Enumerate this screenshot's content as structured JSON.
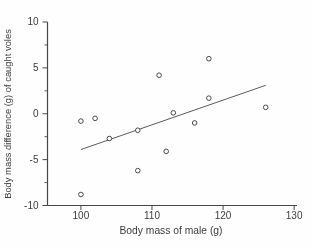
{
  "figure": {
    "background": "#fefefe",
    "ink_color": "#474747",
    "text_color": "#3c3c3c"
  },
  "chart_data": {
    "type": "scatter",
    "xlabel": "Body mass of male (g)",
    "ylabel": "Body mass difference (g) of caught voles",
    "xlim": [
      95.3,
      130.4
    ],
    "ylim": [
      -10,
      10
    ],
    "x_ticks": [
      100,
      110,
      120,
      130
    ],
    "y_ticks": [
      10,
      5,
      0,
      -5,
      -10
    ],
    "y_minor_ticks": [
      7.5,
      2.5,
      -2.5,
      -7.5
    ],
    "grid": false,
    "legend": "none",
    "marker": "open-circle",
    "points": [
      [
        100,
        -0.8
      ],
      [
        100,
        -8.8
      ],
      [
        102,
        -0.5
      ],
      [
        104,
        -2.7
      ],
      [
        108,
        -1.8
      ],
      [
        108,
        -6.2
      ],
      [
        111,
        4.2
      ],
      [
        112,
        -4.1
      ],
      [
        113,
        0.1
      ],
      [
        116,
        -1.0
      ],
      [
        118,
        6.0
      ],
      [
        118,
        1.7
      ],
      [
        126,
        0.7
      ]
    ],
    "trend_line": {
      "x1": 100,
      "y1": -3.9,
      "x2": 126,
      "y2": 3.1
    }
  }
}
